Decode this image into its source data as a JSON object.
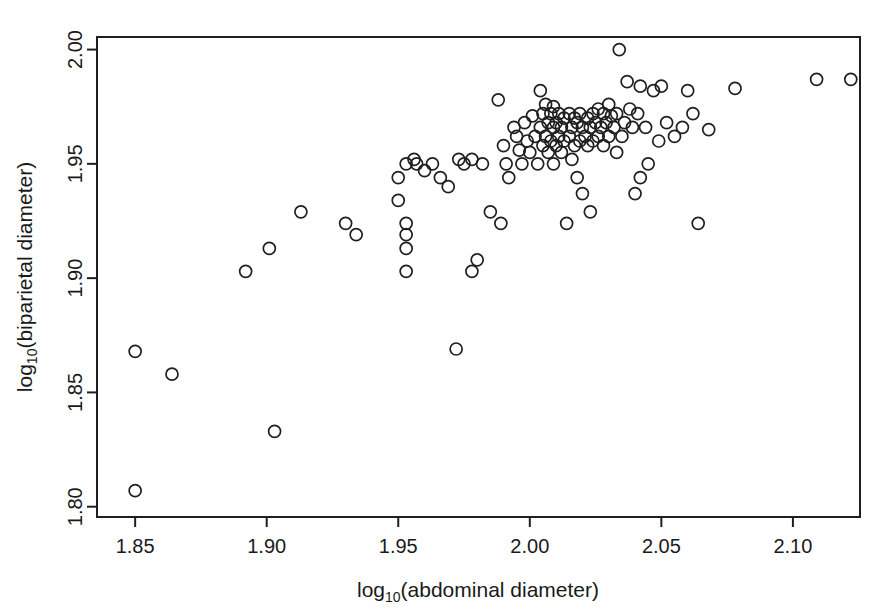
{
  "chart_data": {
    "type": "scatter",
    "title": "",
    "xlabel": "log10(abdominal diameter)",
    "ylabel": "log10(biparietal diameter)",
    "xlabel_parts": {
      "base": "log",
      "subscript": "10",
      "rest": "(abdominal diameter)"
    },
    "ylabel_parts": {
      "base": "log",
      "subscript": "10",
      "rest": "(biparietal diameter)"
    },
    "xlim": [
      1.8355,
      2.1255
    ],
    "ylim": [
      1.7955,
      2.0055
    ],
    "xticks": [
      1.85,
      1.9,
      1.95,
      2.0,
      2.05,
      2.1
    ],
    "xticklabels": [
      "1.85",
      "1.90",
      "1.95",
      "2.00",
      "2.05",
      "2.10"
    ],
    "yticks": [
      1.8,
      1.85,
      1.9,
      1.95,
      2.0
    ],
    "yticklabels": [
      "1.80",
      "1.85",
      "1.90",
      "1.95",
      "2.00"
    ],
    "grid": false,
    "legend": null,
    "marker": "open-circle",
    "marker_radius_px": 6,
    "n_points": 124,
    "x": [
      1.85,
      1.85,
      1.864,
      1.903,
      1.892,
      1.901,
      1.913,
      1.93,
      1.934,
      1.95,
      1.95,
      1.953,
      1.953,
      1.953,
      1.953,
      1.953,
      1.956,
      1.957,
      1.96,
      1.963,
      1.966,
      1.969,
      1.972,
      1.973,
      1.975,
      1.978,
      1.978,
      1.98,
      1.982,
      1.985,
      1.988,
      1.989,
      1.99,
      1.991,
      1.992,
      1.994,
      1.995,
      1.996,
      1.997,
      1.998,
      1.999,
      2.0,
      2.001,
      2.002,
      2.003,
      2.004,
      2.004,
      2.005,
      2.005,
      2.006,
      2.006,
      2.007,
      2.007,
      2.008,
      2.008,
      2.009,
      2.009,
      2.009,
      2.01,
      2.01,
      2.011,
      2.011,
      2.012,
      2.012,
      2.013,
      2.013,
      2.014,
      2.015,
      2.015,
      2.016,
      2.016,
      2.017,
      2.017,
      2.018,
      2.018,
      2.019,
      2.019,
      2.02,
      2.02,
      2.021,
      2.022,
      2.022,
      2.023,
      2.023,
      2.024,
      2.024,
      2.025,
      2.026,
      2.026,
      2.027,
      2.028,
      2.028,
      2.029,
      2.03,
      2.03,
      2.031,
      2.032,
      2.033,
      2.033,
      2.034,
      2.035,
      2.036,
      2.037,
      2.038,
      2.039,
      2.04,
      2.041,
      2.042,
      2.042,
      2.044,
      2.045,
      2.047,
      2.049,
      2.05,
      2.052,
      2.055,
      2.058,
      2.06,
      2.062,
      2.064,
      2.068,
      2.078,
      2.109,
      2.122
    ],
    "y": [
      1.868,
      1.807,
      1.858,
      1.833,
      1.903,
      1.913,
      1.929,
      1.924,
      1.919,
      1.944,
      1.934,
      1.924,
      1.919,
      1.913,
      1.903,
      1.95,
      1.952,
      1.95,
      1.947,
      1.95,
      1.944,
      1.94,
      1.869,
      1.952,
      1.95,
      1.952,
      1.903,
      1.908,
      1.95,
      1.929,
      1.978,
      1.924,
      1.958,
      1.95,
      1.944,
      1.966,
      1.962,
      1.956,
      1.95,
      1.968,
      1.96,
      1.955,
      1.971,
      1.962,
      1.95,
      1.982,
      1.966,
      1.972,
      1.958,
      1.976,
      1.962,
      1.968,
      1.955,
      1.972,
      1.96,
      1.975,
      1.966,
      1.95,
      1.968,
      1.958,
      1.972,
      1.962,
      1.966,
      1.955,
      1.97,
      1.96,
      1.924,
      1.972,
      1.962,
      1.966,
      1.952,
      1.97,
      1.958,
      1.968,
      1.944,
      1.972,
      1.96,
      1.966,
      1.937,
      1.962,
      1.97,
      1.958,
      1.966,
      1.929,
      1.972,
      1.96,
      1.968,
      1.974,
      1.962,
      1.966,
      1.972,
      1.958,
      1.968,
      1.976,
      1.962,
      1.971,
      1.966,
      1.972,
      1.955,
      2.0,
      1.962,
      1.968,
      1.986,
      1.974,
      1.966,
      1.937,
      1.972,
      1.984,
      1.944,
      1.966,
      1.95,
      1.982,
      1.96,
      1.984,
      1.968,
      1.962,
      1.966,
      1.982,
      1.972,
      1.924,
      1.965,
      1.983,
      1.987,
      1.987
    ]
  }
}
